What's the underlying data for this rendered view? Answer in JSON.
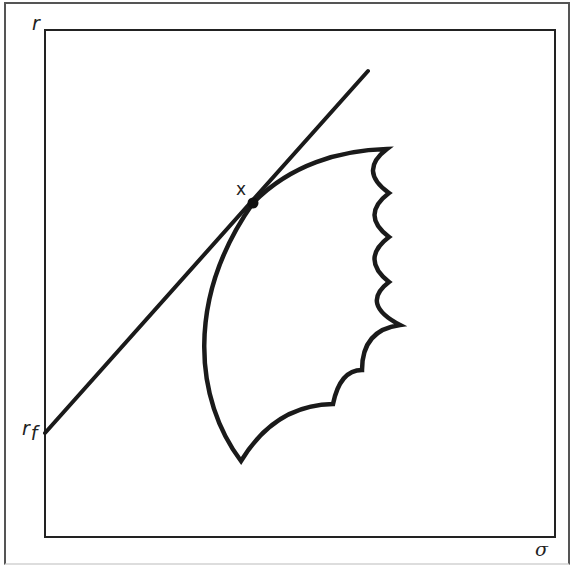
{
  "figure": {
    "type": "efficient-frontier-diagram",
    "y_axis_label": "r",
    "x_axis_label": "σ",
    "intercept_label_main": "r",
    "intercept_label_sub": "f",
    "tangent_point_label": "x",
    "colors": {
      "stroke": "#1a1a1a",
      "frame": "#222222",
      "outer_border": "#555555",
      "background": "#ffffff"
    },
    "elements": {
      "capital_market_line": {
        "from": [
          45,
          433
        ],
        "to": [
          368,
          71
        ]
      },
      "tangency_point": {
        "cx": 253,
        "cy": 203,
        "r": 5
      },
      "feasible_set": "scalloped bullet-shaped region bounded by an upper-left efficient frontier arc"
    }
  }
}
